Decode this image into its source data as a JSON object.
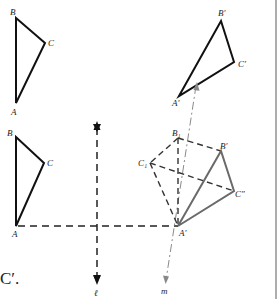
{
  "diagram": {
    "top_left_triangle": {
      "labels": {
        "A": "A",
        "B": "B",
        "C": "C"
      },
      "points": {
        "A": [
          16,
          103
        ],
        "B": [
          16,
          18
        ],
        "C": [
          45,
          43
        ]
      }
    },
    "top_right_triangle": {
      "labels": {
        "A": "A′",
        "B": "B′",
        "C": "C′"
      },
      "points": {
        "A": [
          179,
          96
        ],
        "B": [
          221,
          21
        ],
        "C": [
          234,
          62
        ]
      }
    },
    "bottom_left_triangle": {
      "labels": {
        "A": "A",
        "B": "B",
        "C": "C"
      },
      "points": {
        "A": [
          16,
          226
        ],
        "B": [
          16,
          137
        ],
        "C": [
          44,
          163
        ]
      }
    },
    "construction": {
      "labels": {
        "A": "A′",
        "B1": "B₁",
        "C1": "C₁",
        "B": "B′",
        "C": "C″"
      },
      "points": {
        "A": [
          178,
          226
        ],
        "B1": [
          178,
          138
        ],
        "C1": [
          150,
          163
        ],
        "B": [
          221,
          151
        ],
        "C": [
          234,
          191
        ]
      }
    },
    "line_l": {
      "label": "ℓ",
      "x": 97,
      "y_top": 122,
      "y_bottom": 284
    },
    "line_m": {
      "label": "m",
      "from": [
        196,
        84
      ],
      "to": [
        166,
        282
      ]
    },
    "caption_fragment": "C′.",
    "colors": {
      "solid": "#111111",
      "gray": "#6a6a6a",
      "mline": "#8a8a8a",
      "border": "#777777"
    }
  }
}
